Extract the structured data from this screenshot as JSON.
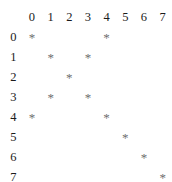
{
  "figure": {
    "title": "",
    "marker_glyph": "*",
    "background_color": "#ffffff",
    "header_text_color": "#1b1b1b",
    "marker_color": "#6e6e6e"
  },
  "chart_data": {
    "type": "heatmap",
    "title": "",
    "xlabel": "",
    "ylabel": "",
    "grid": false,
    "legend": "none",
    "notation": "asterisk-marker matrix / sparsity pattern",
    "column_headers": [
      "0",
      "1",
      "2",
      "3",
      "4",
      "5",
      "6",
      "7"
    ],
    "row_headers": [
      "0",
      "1",
      "2",
      "3",
      "4",
      "5",
      "6",
      "7"
    ],
    "x": [
      0,
      1,
      2,
      3,
      4,
      5,
      6,
      7
    ],
    "y": [
      0,
      1,
      2,
      3,
      4,
      5,
      6,
      7
    ],
    "xlim": [
      0,
      7
    ],
    "ylim": [
      0,
      7
    ],
    "marked_points": [
      {
        "row": 0,
        "col": 0
      },
      {
        "row": 0,
        "col": 4
      },
      {
        "row": 1,
        "col": 1
      },
      {
        "row": 1,
        "col": 3
      },
      {
        "row": 2,
        "col": 2
      },
      {
        "row": 3,
        "col": 1
      },
      {
        "row": 3,
        "col": 3
      },
      {
        "row": 4,
        "col": 0
      },
      {
        "row": 4,
        "col": 4
      },
      {
        "row": 5,
        "col": 5
      },
      {
        "row": 6,
        "col": 6
      },
      {
        "row": 7,
        "col": 7
      }
    ],
    "matrix": [
      [
        1,
        0,
        0,
        0,
        1,
        0,
        0,
        0
      ],
      [
        0,
        1,
        0,
        1,
        0,
        0,
        0,
        0
      ],
      [
        0,
        0,
        1,
        0,
        0,
        0,
        0,
        0
      ],
      [
        0,
        1,
        0,
        1,
        0,
        0,
        0,
        0
      ],
      [
        1,
        0,
        0,
        0,
        1,
        0,
        0,
        0
      ],
      [
        0,
        0,
        0,
        0,
        0,
        1,
        0,
        0
      ],
      [
        0,
        0,
        0,
        0,
        0,
        0,
        1,
        0
      ],
      [
        0,
        0,
        0,
        0,
        0,
        0,
        0,
        1
      ]
    ],
    "cells": [
      [
        "*",
        "",
        "",
        "",
        "*",
        "",
        "",
        ""
      ],
      [
        "",
        "*",
        "",
        "*",
        "",
        "",
        "",
        ""
      ],
      [
        "",
        "",
        "*",
        "",
        "",
        "",
        "",
        ""
      ],
      [
        "",
        "*",
        "",
        "*",
        "",
        "",
        "",
        ""
      ],
      [
        "*",
        "",
        "",
        "",
        "*",
        "",
        "",
        ""
      ],
      [
        "",
        "",
        "",
        "",
        "",
        "*",
        "",
        ""
      ],
      [
        "",
        "",
        "",
        "",
        "",
        "",
        "*",
        ""
      ],
      [
        "",
        "",
        "",
        "",
        "",
        "",
        "",
        "*"
      ]
    ]
  }
}
